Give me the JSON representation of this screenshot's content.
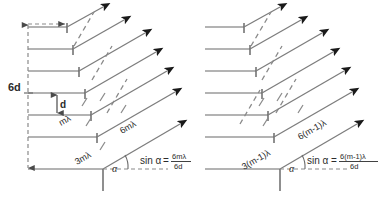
{
  "figure": {
    "colors": {
      "step_line": "#9a9a9a",
      "riser_line": "#6a6a6a",
      "ray_line": "#7d7d7d",
      "arrow_fill": "#1a1a1a",
      "dashed_line": "#8a8a8a",
      "text": "#2b2b2b",
      "background": "#ffffff"
    },
    "geometry": {
      "step_count": 7,
      "step_height_px": 22,
      "ray_angle_deg": 30,
      "panel_count": 2
    }
  },
  "left_panel": {
    "name": "order-m-diagram",
    "dimension_labels": {
      "total": "6d",
      "single": "d"
    },
    "path_labels": {
      "single": "mλ",
      "third": "3mλ",
      "sixth": "6mλ"
    },
    "angle_label": "α",
    "formula": {
      "lhs": "sin α",
      "equals": "=",
      "numerator": "6mλ",
      "denominator": "6d"
    }
  },
  "right_panel": {
    "name": "order-m-minus-1-diagram",
    "path_labels": {
      "third": "3(m-1)λ",
      "sixth": "6(m-1)λ"
    },
    "angle_label": "α",
    "formula": {
      "lhs": "sin α",
      "equals": "=",
      "numerator": "6(m-1)λ",
      "denominator": "6d"
    }
  }
}
